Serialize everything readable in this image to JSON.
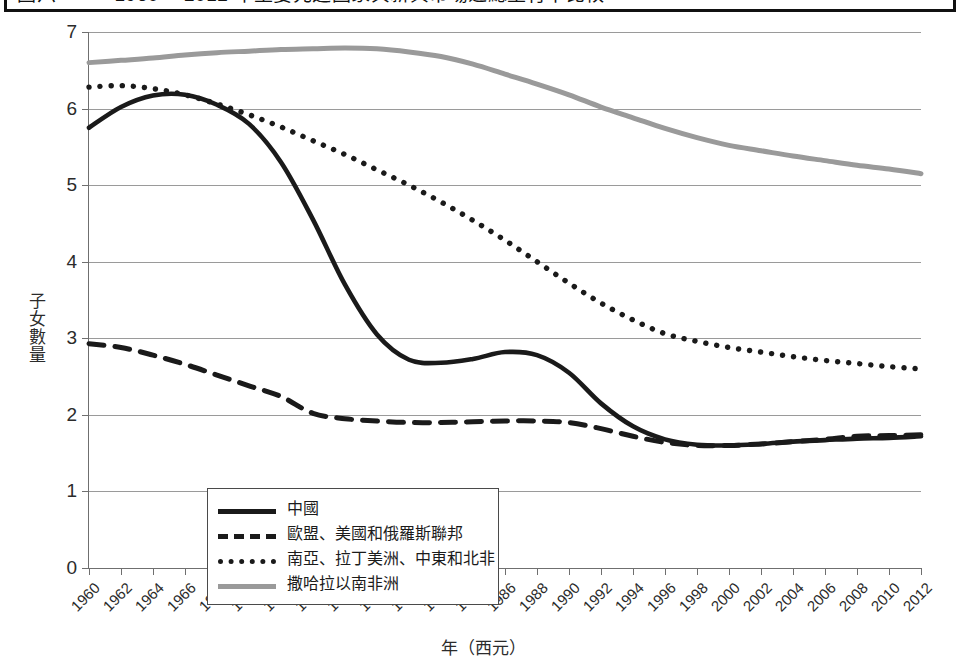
{
  "title_bar": {
    "text": "圖六　　　1960　 2012 年主要先進國家與新興市場之總生育率比較"
  },
  "axes": {
    "y_title": "子女數量",
    "x_title": "年（西元）",
    "y_ticks": [
      "0",
      "1",
      "2",
      "3",
      "4",
      "5",
      "6",
      "7"
    ],
    "x_ticks": [
      "1960",
      "1962",
      "1964",
      "1966",
      "1968",
      "1970",
      "1972",
      "1974",
      "1976",
      "1978",
      "1980",
      "1982",
      "1984",
      "1986",
      "1988",
      "1990",
      "1992",
      "1994",
      "1996",
      "1998",
      "2000",
      "2002",
      "2004",
      "2006",
      "2008",
      "2010",
      "2012"
    ]
  },
  "legend": {
    "items": [
      {
        "label": "中國",
        "style": "solid",
        "color": "#1a1a1a"
      },
      {
        "label": "歐盟、美國和俄羅斯聯邦",
        "style": "dashed",
        "color": "#1a1a1a"
      },
      {
        "label": "南亞、拉丁美洲、中東和北非",
        "style": "dotted",
        "color": "#1a1a1a"
      },
      {
        "label": "撒哈拉以南非洲",
        "style": "solid",
        "color": "#9a9a9a"
      }
    ]
  },
  "chart_data": {
    "type": "line",
    "title": "圖六　　　1960　 2012 年主要先進國家與新興市場之總生育率比較",
    "xlabel": "年（西元）",
    "ylabel": "子女數量",
    "xlim": [
      1960,
      2012
    ],
    "ylim": [
      0,
      7
    ],
    "grid": true,
    "legend_position": "inside-lower-left",
    "x": [
      1960,
      1962,
      1964,
      1966,
      1968,
      1970,
      1972,
      1974,
      1976,
      1978,
      1980,
      1982,
      1984,
      1986,
      1988,
      1990,
      1992,
      1994,
      1996,
      1998,
      2000,
      2002,
      2004,
      2006,
      2008,
      2010,
      2012
    ],
    "series": [
      {
        "name": "中國",
        "style": "solid",
        "color": "#1a1a1a",
        "values": [
          5.75,
          6.02,
          6.17,
          6.18,
          6.05,
          5.8,
          5.3,
          4.55,
          3.7,
          3.05,
          2.72,
          2.68,
          2.73,
          2.82,
          2.78,
          2.55,
          2.15,
          1.85,
          1.68,
          1.61,
          1.6,
          1.62,
          1.65,
          1.67,
          1.69,
          1.7,
          1.72
        ]
      },
      {
        "name": "歐盟、美國和俄羅斯聯邦",
        "style": "dashed",
        "color": "#1a1a1a",
        "values": [
          2.93,
          2.88,
          2.78,
          2.66,
          2.52,
          2.38,
          2.24,
          2.02,
          1.95,
          1.92,
          1.9,
          1.9,
          1.91,
          1.92,
          1.92,
          1.9,
          1.82,
          1.72,
          1.64,
          1.6,
          1.6,
          1.62,
          1.65,
          1.68,
          1.72,
          1.73,
          1.74
        ]
      },
      {
        "name": "南亞、拉丁美洲、中東和北非",
        "style": "dotted",
        "color": "#1a1a1a",
        "values": [
          6.28,
          6.3,
          6.26,
          6.18,
          6.06,
          5.92,
          5.76,
          5.58,
          5.4,
          5.2,
          5.0,
          4.78,
          4.54,
          4.28,
          4.0,
          3.72,
          3.46,
          3.24,
          3.06,
          2.96,
          2.88,
          2.82,
          2.76,
          2.71,
          2.67,
          2.63,
          2.6
        ]
      },
      {
        "name": "撒哈拉以南非洲",
        "style": "solid",
        "color": "#9a9a9a",
        "values": [
          6.6,
          6.63,
          6.66,
          6.7,
          6.73,
          6.75,
          6.77,
          6.78,
          6.79,
          6.78,
          6.74,
          6.68,
          6.58,
          6.45,
          6.32,
          6.18,
          6.02,
          5.88,
          5.74,
          5.62,
          5.52,
          5.45,
          5.38,
          5.32,
          5.26,
          5.21,
          5.15
        ]
      }
    ]
  }
}
